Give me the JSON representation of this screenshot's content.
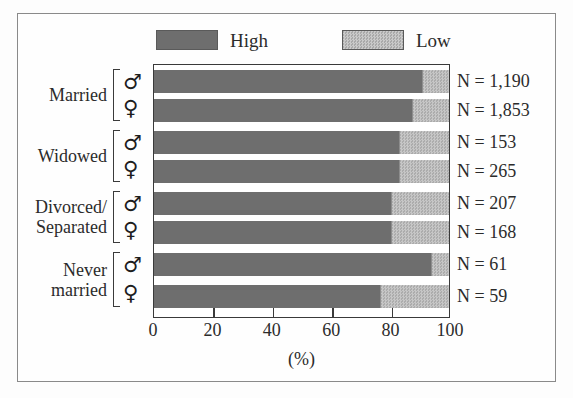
{
  "chart_data": {
    "type": "bar",
    "subtype": "horizontal-stacked-100",
    "title": "",
    "xlabel": "(%)",
    "ylabel": "",
    "xlim": [
      0,
      100
    ],
    "xticks": [
      0,
      20,
      40,
      60,
      80,
      100
    ],
    "xtick_labels": [
      "0",
      "20",
      "40",
      "60",
      "80",
      "100"
    ],
    "grid": false,
    "legend_position": "top",
    "legend": [
      {
        "name": "High",
        "color": "#6e6e6e",
        "pattern": "solid"
      },
      {
        "name": "Low",
        "color": "#b9b9b9",
        "pattern": "stipple"
      }
    ],
    "series": [
      {
        "name": "High",
        "values": [
          91,
          87.5,
          83,
          83,
          80.5,
          80.5,
          94,
          76.5
        ]
      },
      {
        "name": "Low",
        "values": [
          9,
          12.5,
          17,
          17,
          19.5,
          19.5,
          6,
          23.5
        ]
      }
    ],
    "categories": [
      "Married, male",
      "Married, female",
      "Widowed, male",
      "Widowed, female",
      "Divorced/Separated, male",
      "Divorced/Separated, female",
      "Never married, male",
      "Never married, female"
    ],
    "group_labels": [
      "Married",
      "Widowed",
      "Divorced/ Separated",
      "Never married"
    ],
    "annotations": [
      "N = 1,190",
      "N = 1,853",
      "N = 153",
      "N = 265",
      "N = 207",
      "N = 168",
      "N = 61",
      "N = 59"
    ]
  },
  "legend": {
    "high_label": "High",
    "low_label": "Low"
  },
  "axis": {
    "x_title": "(%)",
    "ticks": [
      "0",
      "20",
      "40",
      "60",
      "80",
      "100"
    ]
  },
  "groups": [
    {
      "label_line1": "Married",
      "label_line2": "",
      "male_symbol": "♂",
      "female_symbol": "♀"
    },
    {
      "label_line1": "Widowed",
      "label_line2": "",
      "male_symbol": "♂",
      "female_symbol": "♀"
    },
    {
      "label_line1": "Divorced/",
      "label_line2": "Separated",
      "male_symbol": "♂",
      "female_symbol": "♀"
    },
    {
      "label_line1": "Never",
      "label_line2": "married",
      "male_symbol": "♂",
      "female_symbol": "♀"
    }
  ],
  "bars": [
    {
      "group": "Married",
      "sex": "male",
      "high": 91,
      "low": 9,
      "n_label": "N = 1,190"
    },
    {
      "group": "Married",
      "sex": "female",
      "high": 87.5,
      "low": 12.5,
      "n_label": "N = 1,853"
    },
    {
      "group": "Widowed",
      "sex": "male",
      "high": 83,
      "low": 17,
      "n_label": "N = 153"
    },
    {
      "group": "Widowed",
      "sex": "female",
      "high": 83,
      "low": 17,
      "n_label": "N = 265"
    },
    {
      "group": "Divorced/Separated",
      "sex": "male",
      "high": 80.5,
      "low": 19.5,
      "n_label": "N = 207"
    },
    {
      "group": "Divorced/Separated",
      "sex": "female",
      "high": 80.5,
      "low": 19.5,
      "n_label": "N = 168"
    },
    {
      "group": "Never married",
      "sex": "male",
      "high": 94,
      "low": 6,
      "n_label": "N = 61"
    },
    {
      "group": "Never married",
      "sex": "female",
      "high": 76.5,
      "low": 23.5,
      "n_label": "N = 59"
    }
  ],
  "colors": {
    "high": "#6e6e6e",
    "low": "#b9b9b9",
    "frame": "#8a8a8a",
    "axis": "#3a3a3a",
    "text": "#2b2b2b"
  }
}
